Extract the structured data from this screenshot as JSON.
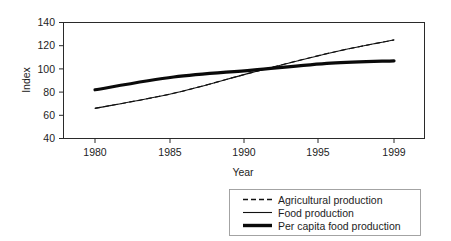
{
  "chart_data": {
    "type": "line",
    "title": "",
    "xlabel": "Year",
    "ylabel": "Index",
    "xlim": [
      1979,
      1999
    ],
    "ylim": [
      40,
      140
    ],
    "grid": false,
    "legend_position": "bottom",
    "x": [
      1980,
      1985,
      1990,
      1995,
      1999
    ],
    "xticklabels": [
      "1980",
      "1985",
      "1990",
      "1995",
      "1999"
    ],
    "yticks": [
      40,
      60,
      80,
      100,
      120,
      140
    ],
    "yticklabels": [
      "40",
      "60",
      "80",
      "100",
      "120",
      "140"
    ],
    "series": [
      {
        "name": "Agricultural production",
        "style": "dashed",
        "values": [
          66,
          79,
          97,
          114,
          125
        ]
      },
      {
        "name": "Food production",
        "style": "thin-solid",
        "values": [
          66,
          79,
          97,
          114,
          125
        ]
      },
      {
        "name": "Per capita food production",
        "style": "thick-solid",
        "values": [
          82,
          93,
          99,
          105,
          107
        ]
      }
    ]
  },
  "axis": {
    "y_label": "Index",
    "x_label": "Year",
    "y_tick_140": "140",
    "y_tick_120": "120",
    "y_tick_100": "100",
    "y_tick_80": "80",
    "y_tick_60": "60",
    "y_tick_40": "40",
    "x_tick_1980": "1980",
    "x_tick_1985": "1985",
    "x_tick_1990": "1990",
    "x_tick_1995": "1995",
    "x_tick_1999": "1999"
  },
  "legend": {
    "entries": [
      {
        "label": "Agricultural production"
      },
      {
        "label": "Food production"
      },
      {
        "label": "Per capita food production"
      }
    ]
  },
  "colors": {
    "line": "#111111",
    "frame": "#2a2a2a",
    "background": "#ffffff",
    "legend_border": "#9a9a9a"
  }
}
